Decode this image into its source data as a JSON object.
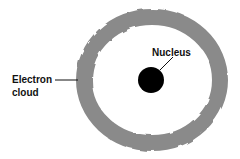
{
  "diagram": {
    "labels": {
      "nucleus": "Nucleus",
      "electron_cloud_line1": "Electron",
      "electron_cloud_line2": "cloud"
    },
    "colors": {
      "background": "#ffffff",
      "cloud": "#8a8a8a",
      "nucleus": "#000000",
      "text": "#111111"
    }
  }
}
